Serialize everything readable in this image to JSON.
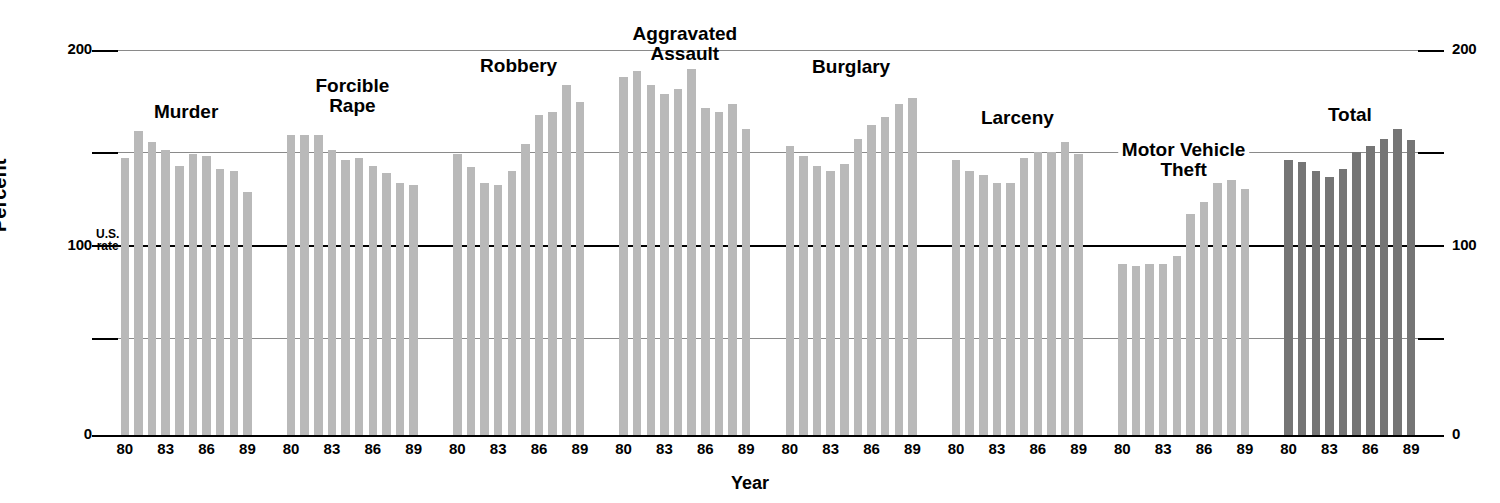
{
  "chart_data": {
    "type": "bar",
    "title": "",
    "xlabel": "Year",
    "ylabel": "Percent",
    "ylim": [
      0,
      200
    ],
    "yticks": [
      0,
      50,
      100,
      150,
      200
    ],
    "ytick_labels_shown": [
      "0",
      "100",
      "200"
    ],
    "grid": true,
    "legend": "none",
    "reference_line": {
      "value": 100,
      "label_line1": "U.S.",
      "label_line2": "rate"
    },
    "x_tick_labels": [
      "80",
      "83",
      "86",
      "89"
    ],
    "categories": [
      "80",
      "81",
      "82",
      "83",
      "84",
      "85",
      "86",
      "87",
      "88",
      "89"
    ],
    "series": [
      {
        "name": "Murder",
        "label_lines": [
          "Murder"
        ],
        "color": "#b9b9b9",
        "values": [
          144,
          158,
          152,
          148,
          140,
          146,
          145,
          138,
          137,
          126
        ]
      },
      {
        "name": "Forcible Rape",
        "label_lines": [
          "Forcible",
          "Rape"
        ],
        "color": "#b9b9b9",
        "values": [
          156,
          156,
          156,
          148,
          143,
          144,
          140,
          136,
          131,
          130
        ]
      },
      {
        "name": "Robbery",
        "label_lines": [
          "Robbery"
        ],
        "color": "#b9b9b9",
        "values": [
          146,
          139,
          131,
          130,
          137,
          151,
          166,
          168,
          182,
          173
        ]
      },
      {
        "name": "Aggravated Assault",
        "label_lines": [
          "Aggravated",
          "Assault"
        ],
        "color": "#b9b9b9",
        "values": [
          186,
          189,
          182,
          177,
          180,
          190,
          170,
          168,
          172,
          159
        ]
      },
      {
        "name": "Burglary",
        "label_lines": [
          "Burglary"
        ],
        "color": "#b9b9b9",
        "values": [
          150,
          145,
          140,
          137,
          141,
          154,
          161,
          165,
          172,
          175
        ]
      },
      {
        "name": "Larceny",
        "label_lines": [
          "Larceny"
        ],
        "color": "#b9b9b9",
        "values": [
          143,
          137,
          135,
          131,
          131,
          144,
          147,
          147,
          152,
          146
        ]
      },
      {
        "name": "Motor Vehicle Theft",
        "label_lines": [
          "Motor Vehicle",
          "Theft"
        ],
        "color": "#b9b9b9",
        "values": [
          89,
          88,
          89,
          89,
          93,
          115,
          121,
          131,
          135,
          128
        ]
      },
      {
        "name": "Total",
        "label_lines": [
          "Total"
        ],
        "color": "#757575",
        "values": [
          143,
          142,
          137,
          134,
          138,
          147,
          150,
          154,
          159,
          153
        ]
      }
    ]
  },
  "axis": {
    "y_top_label": "200",
    "y_mid_label": "100",
    "y_bottom_label": "0",
    "y_title": "Percent",
    "x_title": "Year",
    "us_rate_line1": "U.S.",
    "us_rate_line2": "rate"
  }
}
